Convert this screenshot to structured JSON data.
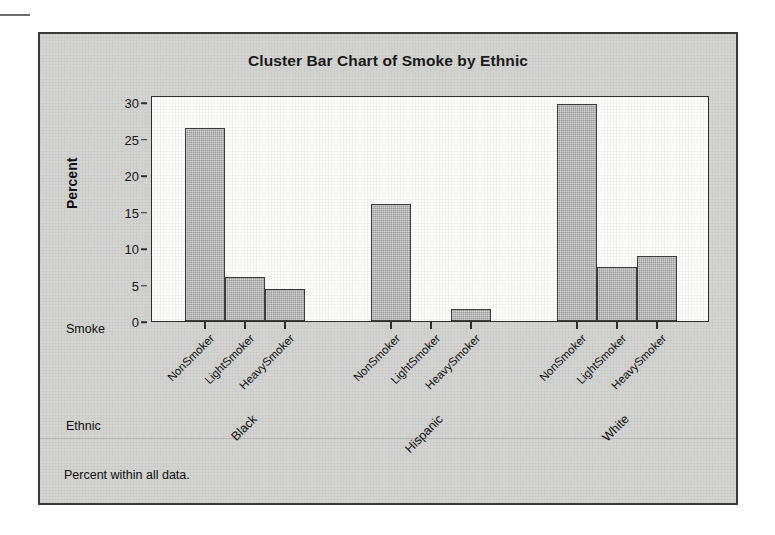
{
  "chart_data": {
    "type": "bar",
    "title": "Cluster Bar Chart of Smoke by Ethnic",
    "xlabel": "Smoke",
    "ylabel": "Percent",
    "grouplabel": "Ethnic",
    "footnote": "Percent within all data.",
    "ylim": [
      0,
      31
    ],
    "yticks": [
      0,
      5,
      10,
      15,
      20,
      25,
      30
    ],
    "ytick_labels": [
      "0",
      "5",
      "10",
      "15",
      "20",
      "25",
      "30"
    ],
    "grid": false,
    "legend": "none",
    "categories": [
      "NonSmoker",
      "LightSmoker",
      "HeavySmoker"
    ],
    "groups": [
      "Black",
      "Hispanic",
      "White"
    ],
    "bar_color": "#9e9e9e",
    "bar_edge_color": "#3c3c3c",
    "series": [
      {
        "name": "Black",
        "values": [
          26.5,
          6.0,
          4.4
        ]
      },
      {
        "name": "Hispanic",
        "values": [
          16.1,
          0.0,
          1.7
        ]
      },
      {
        "name": "White",
        "values": [
          29.7,
          7.4,
          8.9
        ]
      }
    ]
  },
  "frame": {
    "background_color": "#d3d3d1",
    "border_color": "#3a3a3a",
    "plot_background_color": "#fbfbfa"
  }
}
